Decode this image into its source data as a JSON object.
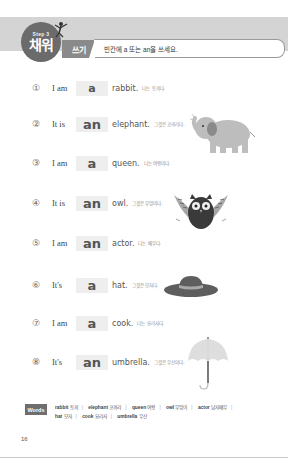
{
  "header": {
    "step_label": "Step 3",
    "badge_title": "채워",
    "section_tag": "쓰기",
    "instruction": "빈칸에 a 또는 an을 쓰세요."
  },
  "exercises": [
    {
      "num": "①",
      "subject": "I am",
      "answer": "a",
      "noun": "rabbit.",
      "translation": "나는 토끼다."
    },
    {
      "num": "②",
      "subject": "It is",
      "answer": "an",
      "noun": "elephant.",
      "translation": "그것은 코끼리다."
    },
    {
      "num": "③",
      "subject": "I am",
      "answer": "a",
      "noun": "queen.",
      "translation": "나는 여왕이다."
    },
    {
      "num": "④",
      "subject": "It is",
      "answer": "an",
      "noun": "owl.",
      "translation": "그것은 부엉이다."
    },
    {
      "num": "⑤",
      "subject": "I am",
      "answer": "an",
      "noun": "actor.",
      "translation": "나는 배우다."
    },
    {
      "num": "⑥",
      "subject": "It's",
      "answer": "a",
      "noun": "hat.",
      "translation": "그것은 모자다."
    },
    {
      "num": "⑦",
      "subject": "I am",
      "answer": "a",
      "noun": "cook.",
      "translation": "나는 요리사다."
    },
    {
      "num": "⑧",
      "subject": "It's",
      "answer": "an",
      "noun": "umbrella.",
      "translation": "그것은 우산이다."
    }
  ],
  "illustrations": {
    "elephant": "elephant-icon",
    "owl": "owl-icon",
    "hat": "hat-icon",
    "umbrella": "umbrella-icon"
  },
  "words": {
    "label": "Words",
    "items": [
      {
        "en": "rabbit",
        "ko": "토끼"
      },
      {
        "en": "elephant",
        "ko": "코끼리"
      },
      {
        "en": "queen",
        "ko": "여왕"
      },
      {
        "en": "owl",
        "ko": "부엉이"
      },
      {
        "en": "actor",
        "ko": "남자배우"
      },
      {
        "en": "hat",
        "ko": "모자"
      },
      {
        "en": "cook",
        "ko": "요리사"
      },
      {
        "en": "umbrella",
        "ko": "우산"
      }
    ]
  },
  "page_number": "16",
  "colors": {
    "header_band": "#d4d4d4",
    "badge": "#6b6b6b",
    "answer_box": "#eeeeee"
  }
}
